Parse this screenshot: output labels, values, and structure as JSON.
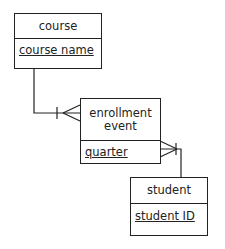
{
  "diagram": {
    "type": "entity-relationship",
    "entities": [
      {
        "id": "course",
        "name": "course",
        "key_attributes": [
          "course name"
        ]
      },
      {
        "id": "enrollment",
        "name": "enrollment event",
        "name_lines": [
          "enrollment",
          "event"
        ],
        "key_attributes": [
          "quarter"
        ]
      },
      {
        "id": "student",
        "name": "student",
        "key_attributes": [
          "student ID"
        ]
      }
    ],
    "relationships": [
      {
        "from": "course",
        "to": "enrollment",
        "from_cardinality": "one",
        "to_cardinality": "many"
      },
      {
        "from": "student",
        "to": "enrollment",
        "from_cardinality": "one",
        "to_cardinality": "many"
      }
    ]
  },
  "colors": {
    "line": "#222222",
    "background": "#ffffff"
  }
}
